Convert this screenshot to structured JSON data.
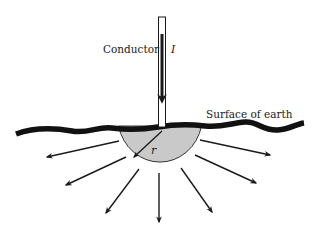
{
  "diagram": {
    "labels": {
      "conductor": "Conductor",
      "current": "I",
      "surface": "Surface of earth",
      "radius": "r"
    },
    "colors": {
      "ink": "#1a1a1a",
      "hemisphere_fill": "#c9c9c9",
      "background": "#ffffff"
    },
    "elements": {
      "conductor": "vertical conductor carrying current I downward into the ground",
      "hemisphere": "hemispherical electrode of radius r below earth surface",
      "current_arrows_count": 8,
      "current_arrows_meaning": "current spreading radially outward into the earth"
    }
  }
}
